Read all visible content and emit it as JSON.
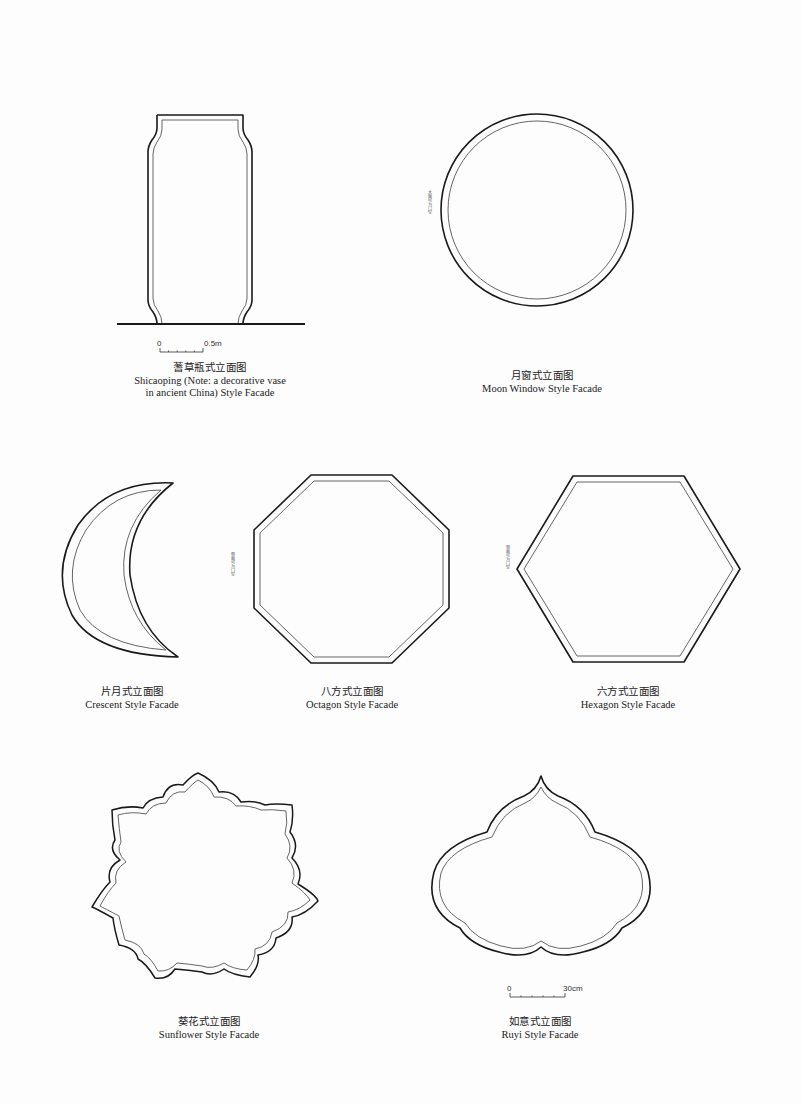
{
  "figures": [
    {
      "id": "shicaoping",
      "caption_zh": "蓍草瓶式立面图",
      "caption_en_line1": "Shicaoping (Note: a decorative vase",
      "caption_en_line2": "in ancient China) Style Facade",
      "scale_bar": {
        "start": "0",
        "end": "0.5m"
      }
    },
    {
      "id": "moon-window",
      "caption_zh": "月窗式立面图",
      "caption_en": "Moon Window Style Facade",
      "side_note": "大面可为门空"
    },
    {
      "id": "crescent",
      "caption_zh": "片月式立面图",
      "caption_en": "Crescent Style Facade"
    },
    {
      "id": "octagon",
      "caption_zh": "八方式立面图",
      "caption_en": "Octagon Style Facade",
      "side_note": "侧面可为门空"
    },
    {
      "id": "hexagon",
      "caption_zh": "六方式立面图",
      "caption_en": "Hexagon Style Facade",
      "side_note": "侧面可为门空"
    },
    {
      "id": "sunflower",
      "caption_zh": "葵花式立面图",
      "caption_en": "Sunflower Style Facade"
    },
    {
      "id": "ruyi",
      "caption_zh": "如意式立面图",
      "caption_en": "Ruyi Style Facade",
      "scale_bar": {
        "start": "0",
        "end": "30cm"
      }
    }
  ],
  "colors": {
    "outline": "#1a1a1a",
    "inner_line": "#555555",
    "background": "#fdfdfd"
  }
}
